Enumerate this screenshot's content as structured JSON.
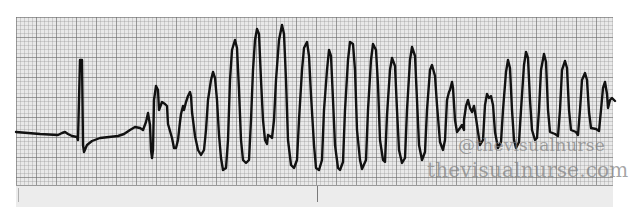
{
  "strip": {
    "paper_color": "#e9e9e9",
    "grid_major_spacing_px": 20,
    "grid_minor_spacing_px": 4,
    "trace_color": "#111111"
  },
  "rhythm": {
    "segments": [
      "sinus-beat-baseline",
      "single-narrow-qrs-complex",
      "premature-beat-onset",
      "polymorphic-wide-oscillations-increasing-amplitude",
      "peak-amplitude-sinusoidal-waves",
      "decreasing-then-irregular-oscillations"
    ]
  },
  "watermark": {
    "handle": "@thevisualnurse",
    "site": "thevisualnurse.com"
  }
}
